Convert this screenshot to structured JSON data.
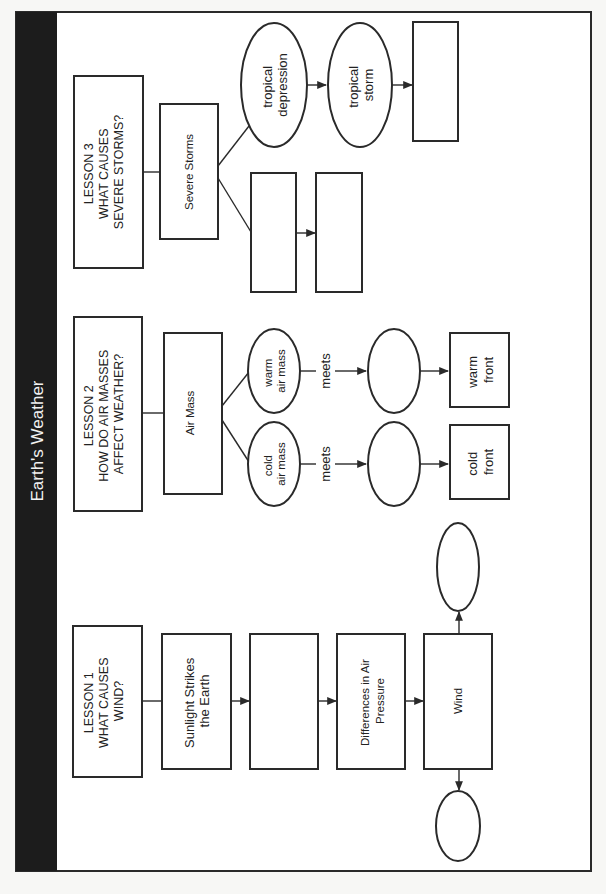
{
  "title": "Earth's Weather",
  "colors": {
    "title_bar": "#1c1c1c",
    "title_text": "#f2f2f2",
    "frame": "#2a2a2a",
    "background": "#ffffff",
    "page": "#f7f7f5"
  },
  "lesson1": {
    "heading": [
      "LESSON 1",
      "WHAT CAUSES",
      "WIND?"
    ],
    "nodes": {
      "sunlight": [
        "Sunlight Strikes",
        "the Earth"
      ],
      "blank1": "",
      "differences": [
        "Differences in Air",
        "Pressure"
      ],
      "wind": "Wind",
      "wind_oval_top": "",
      "wind_oval_bottom": ""
    }
  },
  "lesson2": {
    "heading": [
      "LESSON 2",
      "HOW DO AIR MASSES",
      "AFFECT WEATHER?"
    ],
    "nodes": {
      "air_mass": "Air Mass",
      "warm_air_mass": [
        "warm",
        "air mass"
      ],
      "cold_air_mass": [
        "cold",
        "air mass"
      ],
      "meets_warm": "meets",
      "meets_cold": "meets",
      "warm_blank_oval": "",
      "cold_blank_oval": "",
      "warm_front": [
        "warm",
        "front"
      ],
      "cold_front": [
        "cold",
        "front"
      ]
    }
  },
  "lesson3": {
    "heading": [
      "LESSON 3",
      "WHAT CAUSES",
      "SEVERE STORMS?"
    ],
    "nodes": {
      "severe_storms": "Severe Storms",
      "tropical_depression": [
        "tropical",
        "depression"
      ],
      "tropical_storm": [
        "tropical",
        "storm"
      ],
      "blank_after_storm": "",
      "blank_branch_1": "",
      "blank_branch_2": ""
    }
  }
}
